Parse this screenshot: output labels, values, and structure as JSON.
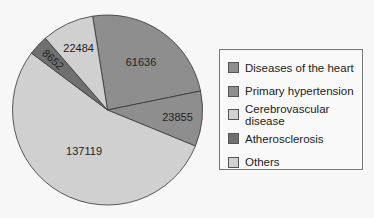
{
  "chart_data": {
    "type": "pie",
    "title": "",
    "categories": [
      "Diseases of the heart",
      "Primary hypertension",
      "Others",
      "Atherosclerosis",
      "Cerebrovascular disease"
    ],
    "values": [
      61636,
      23855,
      137119,
      8652,
      22484
    ],
    "colors": [
      "#8e8e8e",
      "#8e8e8e",
      "#d0d0d0",
      "#707070",
      "#d0d0d0"
    ],
    "start_angle_deg": -9,
    "direction": "clockwise",
    "data_labels": [
      "61636",
      "23855",
      "137119",
      "8652",
      "22484"
    ],
    "legend_position": "right"
  },
  "legend": {
    "items": [
      {
        "label": "Diseases of the heart",
        "color": "#8e8e8e"
      },
      {
        "label": "Primary hypertension",
        "color": "#8e8e8e"
      },
      {
        "label": "Cerebrovascular disease",
        "color": "#d0d0d0"
      },
      {
        "label": "Atherosclerosis",
        "color": "#707070"
      },
      {
        "label": "Others",
        "color": "#d0d0d0"
      }
    ]
  }
}
